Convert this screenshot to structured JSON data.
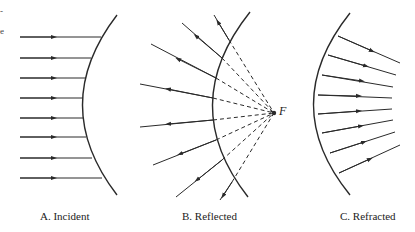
{
  "diagram": {
    "panels": [
      {
        "id": "A",
        "caption": "A.  Incident",
        "description": "Parallel incident rays travelling right toward concave surface"
      },
      {
        "id": "B",
        "caption": "B.  Reflected",
        "description": "Rays reflected from surface, diverging from virtual focus F (dashed extensions)"
      },
      {
        "id": "C",
        "caption": "C.  Refracted",
        "description": "Rays refracted through surface, converging to the right"
      }
    ],
    "focus_label": "F",
    "edge_marks": [
      "-",
      "e"
    ],
    "colors": {
      "line": "#2a2a2a",
      "background": "#ffffff"
    }
  }
}
